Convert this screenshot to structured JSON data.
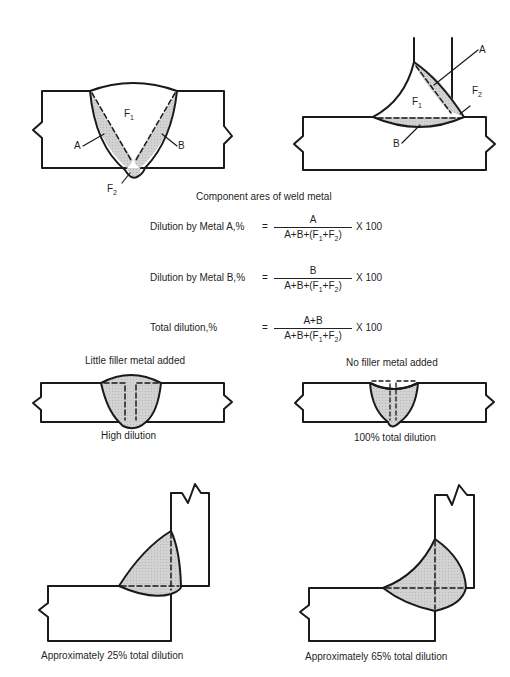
{
  "figure": {
    "caption": "Component ares of weld metal",
    "colors": {
      "line": "#1a1a1a",
      "fill": "#cfcfcf",
      "background": "#ffffff"
    }
  },
  "top_left_diagram": {
    "type": "butt-weld",
    "labels": {
      "F1": "F",
      "F1_sub": "1",
      "A": "A",
      "B": "B",
      "F2": "F",
      "F2_sub": "2"
    }
  },
  "top_right_diagram": {
    "type": "fillet-weld",
    "labels": {
      "A": "A",
      "B": "B",
      "F1": "F",
      "F1_sub": "1",
      "F2": "F",
      "F2_sub": "2"
    }
  },
  "formulas": [
    {
      "name": "Dilution by Metal A,%",
      "eq": "=",
      "numerator": "A",
      "denominator_pre": "A+B+(F",
      "sub1": "1",
      "mid": "+F",
      "sub2": "2",
      "post": ")",
      "multiplier": "X 100"
    },
    {
      "name": "Dilution by Metal B,%",
      "eq": "=",
      "numerator": "B",
      "denominator_pre": "A+B+(F",
      "sub1": "1",
      "mid": "+F",
      "sub2": "2",
      "post": ")",
      "multiplier": "X 100"
    },
    {
      "name": "Total dilution,%",
      "eq": "=",
      "numerator": "A+B",
      "denominator_pre": "A+B+(F",
      "sub1": "1",
      "mid": "+F",
      "sub2": "2",
      "post": ")",
      "multiplier": "X 100"
    }
  ],
  "examples": [
    {
      "id": "little-filler",
      "title": "Little filler metal added",
      "caption": "High dilution"
    },
    {
      "id": "no-filler",
      "title": "No filler metal added",
      "caption": "100% total dilution"
    },
    {
      "id": "fillet-25",
      "title": "",
      "caption": "Approximately 25% total dilution"
    },
    {
      "id": "fillet-65",
      "title": "",
      "caption": "Approximately 65% total dilution"
    }
  ]
}
